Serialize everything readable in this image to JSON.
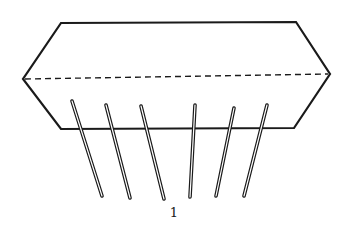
{
  "figure": {
    "caption": "1",
    "block": {
      "points": [
        [
          61,
          23
        ],
        [
          296,
          22
        ],
        [
          330,
          74
        ],
        [
          294,
          128
        ],
        [
          61,
          129
        ],
        [
          23,
          79
        ]
      ],
      "dashed_line": [
        [
          25,
          79
        ],
        [
          328,
          74
        ]
      ]
    },
    "pins": [
      {
        "top": [
          72,
          101
        ],
        "bottom": [
          102,
          196
        ]
      },
      {
        "top": [
          106,
          105
        ],
        "bottom": [
          130,
          198
        ]
      },
      {
        "top": [
          141,
          106
        ],
        "bottom": [
          164,
          199
        ]
      },
      {
        "top": [
          195,
          105
        ],
        "bottom": [
          190,
          197
        ]
      },
      {
        "top": [
          234,
          108
        ],
        "bottom": [
          216,
          196
        ]
      },
      {
        "top": [
          267,
          105
        ],
        "bottom": [
          244,
          196
        ]
      }
    ],
    "colors": {
      "stroke": "#1a1a1a",
      "background": "#ffffff"
    }
  }
}
